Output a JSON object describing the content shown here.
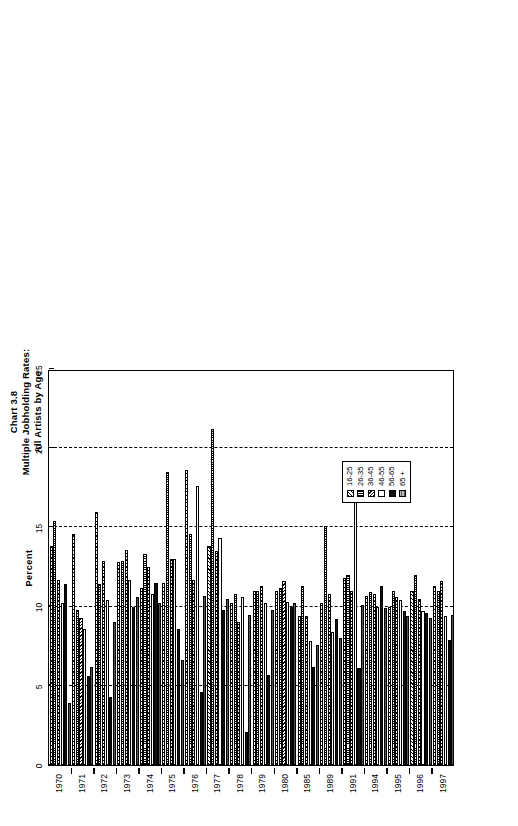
{
  "chart_data": {
    "type": "bar",
    "orientation": "horizontal",
    "title": "Chart 3.8",
    "subtitle_lines": [
      "Multiple Jobholding Rates:",
      "All Artists by Age"
    ],
    "xlabel": "Percent",
    "ylabel": "",
    "xlim": [
      0,
      25
    ],
    "xticks": [
      0,
      5,
      10,
      15,
      20,
      25
    ],
    "xtick_labels": [
      "0",
      "5",
      "10",
      "15",
      "20",
      "25"
    ],
    "grid": true,
    "grid_axis": "x",
    "legend_position": "lower-right",
    "categories": [
      "1970",
      "1971",
      "1972",
      "1973",
      "1974",
      "1975",
      "1976",
      "1977",
      "1978",
      "1979",
      "1980",
      "1985",
      "1989",
      "1991",
      "1994",
      "1995",
      "1996",
      "1997"
    ],
    "series": [
      {
        "name": "16-25",
        "pattern": "diagonal-hatch-left",
        "values": [
          13.8,
          14.6,
          16.0,
          12.8,
          11.2,
          11.5,
          18.6,
          13.8,
          10.2,
          11.0,
          11.0,
          9.4,
          10.2,
          11.8,
          10.7,
          10.0,
          11.0,
          11.3
        ]
      },
      {
        "name": "26-35",
        "pattern": "vertical-hatch",
        "values": [
          15.4,
          9.8,
          11.4,
          12.9,
          13.3,
          18.5,
          14.6,
          21.2,
          10.8,
          11.0,
          11.2,
          11.3,
          15.1,
          12.0,
          10.9,
          11.0,
          12.0,
          11.0
        ]
      },
      {
        "name": "36-45",
        "pattern": "diagonal-hatch-right",
        "values": [
          11.7,
          9.3,
          12.9,
          13.6,
          12.5,
          13.0,
          11.7,
          13.5,
          9.0,
          11.3,
          11.6,
          9.4,
          10.8,
          11.0,
          10.8,
          10.6,
          10.5,
          11.6
        ]
      },
      {
        "name": "46-55",
        "pattern": "white",
        "values": [
          10.2,
          8.6,
          10.4,
          11.7,
          10.8,
          13.0,
          17.6,
          14.3,
          10.6,
          10.2,
          10.3,
          7.8,
          8.4,
          17.4,
          10.0,
          10.4,
          9.7,
          9.4
        ]
      },
      {
        "name": "56-65",
        "pattern": "solid-black",
        "values": [
          11.4,
          5.6,
          4.3,
          10.0,
          11.5,
          8.6,
          4.6,
          9.8,
          2.1,
          5.7,
          10.0,
          6.2,
          9.2,
          6.1,
          11.3,
          9.7,
          9.6,
          7.9
        ]
      },
      {
        "name": "65 +",
        "pattern": "gray-fill",
        "values": [
          3.9,
          6.2,
          9.0,
          10.6,
          10.2,
          6.6,
          10.7,
          10.5,
          9.5,
          9.8,
          10.2,
          7.6,
          8.0,
          10.1,
          9.9,
          9.4,
          9.3,
          9.5
        ]
      }
    ]
  },
  "legend": {
    "entries": [
      {
        "label": "16-25"
      },
      {
        "label": "26-35"
      },
      {
        "label": "36-45"
      },
      {
        "label": "46-55"
      },
      {
        "label": "56-65"
      },
      {
        "label": "65 +"
      }
    ]
  }
}
